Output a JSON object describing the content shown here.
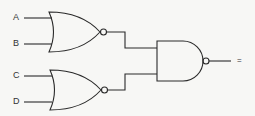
{
  "diagram": {
    "type": "logic-circuit",
    "inputs": [
      {
        "label": "A",
        "gate": "nor-top"
      },
      {
        "label": "B",
        "gate": "nor-top"
      },
      {
        "label": "C",
        "gate": "nor-bottom"
      },
      {
        "label": "D",
        "gate": "nor-bottom"
      }
    ],
    "gates": [
      {
        "id": "nor-top",
        "kind": "NOR",
        "inputs": [
          "A",
          "B"
        ]
      },
      {
        "id": "nor-bottom",
        "kind": "NOR",
        "inputs": [
          "C",
          "D"
        ]
      },
      {
        "id": "nand-out",
        "kind": "NAND",
        "inputs": [
          "nor-top",
          "nor-bottom"
        ]
      }
    ],
    "output_label": "=",
    "colors": {
      "line": "#2a2a2a",
      "background": "#f7f7f5"
    }
  }
}
